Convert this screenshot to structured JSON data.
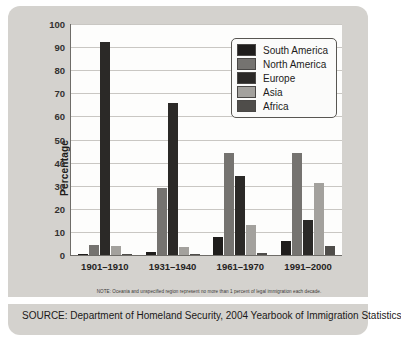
{
  "chart_data": {
    "type": "bar",
    "title": "",
    "xlabel": "",
    "ylabel": "Percentage",
    "ylim": [
      0,
      100
    ],
    "ytick_step": 10,
    "yticks": [
      100,
      90,
      80,
      70,
      60,
      50,
      40,
      30,
      20,
      10,
      0
    ],
    "grid": true,
    "legend_position": "top-right inside plot",
    "categories": [
      "1901–1910",
      "1931–1940",
      "1961–1970",
      "1991–2000"
    ],
    "series": [
      {
        "name": "South America",
        "color": "#1f1d1c",
        "values": [
          0.5,
          1.5,
          8,
          6
        ]
      },
      {
        "name": "North America",
        "color": "#757370",
        "values": [
          4.5,
          29,
          44,
          44
        ]
      },
      {
        "name": "Europe",
        "color": "#2b2927",
        "values": [
          92,
          66,
          34,
          15
        ]
      },
      {
        "name": "Asia",
        "color": "#a3a19d",
        "values": [
          4,
          3.5,
          13,
          31
        ]
      },
      {
        "name": "Africa",
        "color": "#4f4d4a",
        "values": [
          0.3,
          0.4,
          1,
          4
        ]
      }
    ],
    "note": "NOTE: Oceania and unspecified region represent no more than 1 percent of legal immigration each decade.",
    "source": "SOURCE: Department of Homeland Security, 2004 Yearbook of Immigration Statistics"
  },
  "colors": {
    "page_background": "#ffffff",
    "panel_background": "#d4d2ce",
    "plot_background": "#fdfdfc",
    "axis": "#6e6c68",
    "gridline": "#c9c7c3"
  }
}
